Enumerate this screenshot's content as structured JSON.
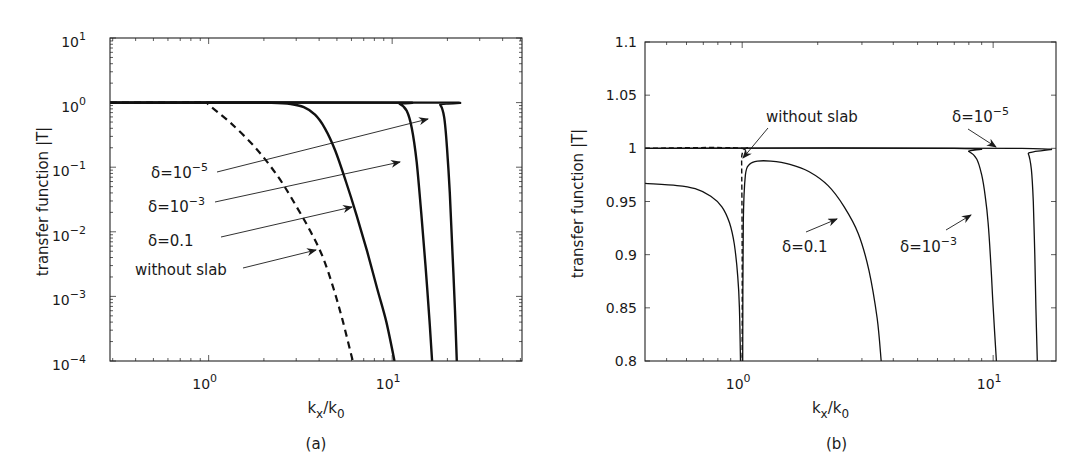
{
  "chart_data": [
    {
      "id": "a",
      "type": "line",
      "panel_label": "(a)",
      "xlabel": "k_x/k_0",
      "ylabel": "transfer function |T|",
      "xscale": "log",
      "yscale": "log",
      "xlim": [
        0.29,
        51
      ],
      "ylim": [
        0.0001,
        10
      ],
      "xticks": [
        {
          "value": 1,
          "label": "10",
          "exp": "0"
        },
        {
          "value": 10,
          "label": "10",
          "exp": "1"
        }
      ],
      "yticks": [
        {
          "value": 10,
          "label": "10",
          "exp": "1"
        },
        {
          "value": 1,
          "label": "10",
          "exp": "0"
        },
        {
          "value": 0.1,
          "label": "10",
          "exp": "−1"
        },
        {
          "value": 0.01,
          "label": "10",
          "exp": "−2"
        },
        {
          "value": 0.001,
          "label": "10",
          "exp": "−3"
        },
        {
          "value": 0.0001,
          "label": "10",
          "exp": "−4"
        }
      ],
      "grid": false,
      "box": {
        "left": 110,
        "top": 38,
        "right": 522,
        "bottom": 361
      },
      "series": [
        {
          "name": "without slab",
          "style": "dashed",
          "width": 2.2,
          "x": [
            0.29,
            0.6,
            0.98,
            1.0,
            1.3,
            1.8,
            2.4,
            3.0,
            3.6,
            4.2,
            4.8,
            5.4,
            6.1
          ],
          "y": [
            1.0,
            1.0,
            1.0,
            0.92,
            0.5,
            0.2,
            0.07,
            0.025,
            0.01,
            0.004,
            0.0013,
            0.0004,
            0.0001
          ]
        },
        {
          "name": "δ=0.1",
          "style": "solid",
          "width": 2.4,
          "x": [
            0.29,
            1.5,
            2.2,
            2.8,
            3.3,
            3.8,
            4.3,
            4.9,
            5.6,
            6.4,
            7.3,
            8.3,
            9.3,
            10.3
          ],
          "y": [
            1.0,
            1.0,
            0.99,
            0.95,
            0.85,
            0.65,
            0.4,
            0.18,
            0.06,
            0.018,
            0.005,
            0.0013,
            0.0004,
            0.0001
          ]
        },
        {
          "name": "δ=10^-3",
          "style": "solid",
          "width": 2.4,
          "x": [
            0.29,
            9.5,
            11.0,
            12.0,
            12.8,
            13.6,
            14.4,
            15.2,
            16.0,
            16.5
          ],
          "y": [
            1.0,
            1.0,
            0.95,
            0.75,
            0.4,
            0.12,
            0.02,
            0.003,
            0.0004,
            0.0001
          ]
        },
        {
          "name": "δ=10^-5",
          "style": "solid",
          "width": 2.4,
          "x": [
            0.29,
            17.0,
            18.3,
            19.2,
            19.9,
            20.6,
            21.3,
            22.0,
            22.5
          ],
          "y": [
            1.0,
            1.0,
            0.92,
            0.6,
            0.2,
            0.04,
            0.005,
            0.0006,
            0.0001
          ]
        }
      ],
      "annotations": [
        {
          "text": "δ=10",
          "exp": "−5",
          "x": 151,
          "y": 178,
          "arrow_from": [
            217,
            172
          ],
          "arrow_to": [
            428,
            119
          ]
        },
        {
          "text": "δ=10",
          "exp": "−3",
          "x": 148,
          "y": 212,
          "arrow_from": [
            215,
            202
          ],
          "arrow_to": [
            400,
            162
          ]
        },
        {
          "text": "δ=0.1",
          "x": 148,
          "y": 246,
          "arrow_from": [
            221,
            237
          ],
          "arrow_to": [
            352,
            207
          ]
        },
        {
          "text": "without slab",
          "x": 135,
          "y": 275,
          "arrow_from": [
            243,
            268
          ],
          "arrow_to": [
            316,
            250
          ]
        }
      ]
    },
    {
      "id": "b",
      "type": "line",
      "panel_label": "(b)",
      "xlabel": "k_x/k_0",
      "ylabel": "transfer function |T|",
      "xscale": "log",
      "yscale": "linear",
      "xlim": [
        0.41,
        17.8
      ],
      "ylim": [
        0.8,
        1.1
      ],
      "xticks": [
        {
          "value": 1,
          "label": "10",
          "exp": "0"
        },
        {
          "value": 10,
          "label": "10",
          "exp": "1"
        }
      ],
      "yticks": [
        {
          "value": 1.1,
          "label": "1.1"
        },
        {
          "value": 1.05,
          "label": "1.05"
        },
        {
          "value": 1.0,
          "label": "1"
        },
        {
          "value": 0.95,
          "label": "0.95"
        },
        {
          "value": 0.9,
          "label": "0.9"
        },
        {
          "value": 0.85,
          "label": "0.85"
        },
        {
          "value": 0.8,
          "label": "0.8"
        }
      ],
      "grid": false,
      "box": {
        "left": 645,
        "top": 42,
        "right": 1056,
        "bottom": 361
      },
      "series": [
        {
          "name": "without slab",
          "style": "dashed",
          "width": 1.4,
          "x": [
            0.41,
            0.99,
            0.995,
            1.0,
            1.0
          ],
          "y": [
            1.0,
            1.0,
            0.99,
            0.9,
            0.8
          ]
        },
        {
          "name": "δ=0.1 (below k0)",
          "style": "solid",
          "width": 1.3,
          "x": [
            0.41,
            0.55,
            0.65,
            0.75,
            0.83,
            0.89,
            0.93,
            0.96,
            0.975,
            0.985
          ],
          "y": [
            0.967,
            0.965,
            0.962,
            0.955,
            0.945,
            0.93,
            0.91,
            0.88,
            0.85,
            0.8
          ]
        },
        {
          "name": "δ=0.1",
          "style": "solid",
          "width": 1.3,
          "x": [
            1.005,
            1.01,
            1.03,
            1.07,
            1.15,
            1.3,
            1.55,
            1.85,
            2.2,
            2.55,
            2.9,
            3.2,
            3.45,
            3.58
          ],
          "y": [
            0.8,
            0.93,
            0.975,
            0.985,
            0.988,
            0.988,
            0.985,
            0.978,
            0.965,
            0.945,
            0.92,
            0.885,
            0.84,
            0.8
          ]
        },
        {
          "name": "δ=10^-3",
          "style": "solid",
          "width": 1.3,
          "x": [
            0.41,
            7.0,
            8.0,
            8.6,
            9.0,
            9.3,
            9.55,
            9.8,
            10.0,
            10.3
          ],
          "y": [
            1.0,
            1.0,
            0.997,
            0.99,
            0.975,
            0.955,
            0.93,
            0.89,
            0.85,
            0.8
          ]
        },
        {
          "name": "δ=10^-5",
          "style": "solid",
          "width": 1.3,
          "x": [
            0.41,
            13.0,
            13.8,
            14.2,
            14.45,
            14.65,
            14.8,
            15.0
          ],
          "y": [
            1.0,
            1.0,
            0.995,
            0.98,
            0.95,
            0.9,
            0.85,
            0.8
          ]
        }
      ],
      "annotations": [
        {
          "text": "without slab",
          "x": 766,
          "y": 122,
          "arrow_from": [
            768,
            128
          ],
          "arrow_to": [
            743,
            158
          ]
        },
        {
          "text": "δ=10",
          "exp": "−5",
          "x": 952,
          "y": 122,
          "arrow_from": [
            968,
            129
          ],
          "arrow_to": [
            996,
            147
          ]
        },
        {
          "text": "δ=0.1",
          "x": 782,
          "y": 252,
          "arrow_from": [
            806,
            232
          ],
          "arrow_to": [
            837,
            219
          ]
        },
        {
          "text": "δ=10",
          "exp": "−3",
          "x": 900,
          "y": 252,
          "arrow_from": [
            946,
            230
          ],
          "arrow_to": [
            971,
            215
          ]
        }
      ]
    }
  ]
}
